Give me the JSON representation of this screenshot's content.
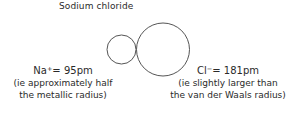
{
  "title": "Sodium chloride",
  "ions": [
    {
      "symbol": "Na",
      "charge": "+",
      "value": "= 95pm",
      "note_line1": "(ie approximately half",
      "note_line2": "the metallic radius)",
      "circle": {
        "cx": 121.5,
        "cy": 49.5,
        "r": 14.5
      }
    },
    {
      "symbol": "Cl",
      "charge": "−",
      "value": "= 181pm",
      "note_line1": "(ie slightly larger than",
      "note_line2": "the van der Waals radius)",
      "circle": {
        "cx": 163,
        "cy": 49.5,
        "r": 26.5
      }
    }
  ],
  "colors": {
    "stroke": "#555555",
    "text": "#2a2a2a"
  }
}
